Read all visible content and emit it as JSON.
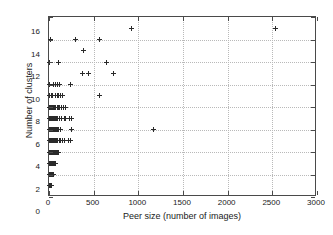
{
  "chart_data": {
    "type": "scatter",
    "title": "",
    "xlabel": "Peer size (number of images)",
    "ylabel": "Number of clusters",
    "xlim": [
      0,
      3000
    ],
    "ylim": [
      0,
      16
    ],
    "xticks": [
      0,
      500,
      1000,
      1500,
      2000,
      2500,
      3000
    ],
    "yticks": [
      0,
      2,
      4,
      6,
      8,
      10,
      12,
      14,
      16
    ],
    "grid": true,
    "legend": null,
    "marker": "+",
    "marker_color": "#2a2a2a",
    "series": [
      {
        "name": "peers",
        "points": [
          [
            8,
            1
          ],
          [
            12,
            1
          ],
          [
            16,
            1
          ],
          [
            20,
            1
          ],
          [
            24,
            1
          ],
          [
            28,
            1
          ],
          [
            10,
            1
          ],
          [
            14,
            1
          ],
          [
            8,
            2
          ],
          [
            14,
            2
          ],
          [
            20,
            2
          ],
          [
            26,
            2
          ],
          [
            32,
            2
          ],
          [
            38,
            2
          ],
          [
            44,
            2
          ],
          [
            50,
            2
          ],
          [
            12,
            2
          ],
          [
            18,
            2
          ],
          [
            24,
            2
          ],
          [
            30,
            2
          ],
          [
            8,
            3
          ],
          [
            14,
            3
          ],
          [
            20,
            3
          ],
          [
            26,
            3
          ],
          [
            32,
            3
          ],
          [
            38,
            3
          ],
          [
            44,
            3
          ],
          [
            50,
            3
          ],
          [
            56,
            3
          ],
          [
            62,
            3
          ],
          [
            68,
            3
          ],
          [
            16,
            3
          ],
          [
            22,
            3
          ],
          [
            34,
            3
          ],
          [
            46,
            3
          ],
          [
            8,
            4
          ],
          [
            14,
            4
          ],
          [
            20,
            4
          ],
          [
            26,
            4
          ],
          [
            32,
            4
          ],
          [
            38,
            4
          ],
          [
            44,
            4
          ],
          [
            50,
            4
          ],
          [
            56,
            4
          ],
          [
            62,
            4
          ],
          [
            68,
            4
          ],
          [
            74,
            4
          ],
          [
            80,
            4
          ],
          [
            95,
            4
          ],
          [
            110,
            4
          ],
          [
            18,
            4
          ],
          [
            30,
            4
          ],
          [
            42,
            4
          ],
          [
            54,
            4
          ],
          [
            8,
            5
          ],
          [
            14,
            5
          ],
          [
            20,
            5
          ],
          [
            26,
            5
          ],
          [
            32,
            5
          ],
          [
            38,
            5
          ],
          [
            44,
            5
          ],
          [
            50,
            5
          ],
          [
            56,
            5
          ],
          [
            62,
            5
          ],
          [
            70,
            5
          ],
          [
            78,
            5
          ],
          [
            86,
            5
          ],
          [
            100,
            5
          ],
          [
            115,
            5
          ],
          [
            130,
            5
          ],
          [
            150,
            5
          ],
          [
            170,
            5
          ],
          [
            215,
            5
          ],
          [
            240,
            5
          ],
          [
            24,
            5
          ],
          [
            36,
            5
          ],
          [
            8,
            6
          ],
          [
            14,
            6
          ],
          [
            20,
            6
          ],
          [
            26,
            6
          ],
          [
            32,
            6
          ],
          [
            38,
            6
          ],
          [
            44,
            6
          ],
          [
            50,
            6
          ],
          [
            56,
            6
          ],
          [
            64,
            6
          ],
          [
            72,
            6
          ],
          [
            80,
            6
          ],
          [
            90,
            6
          ],
          [
            105,
            6
          ],
          [
            130,
            6
          ],
          [
            250,
            6
          ],
          [
            1170,
            6
          ],
          [
            18,
            6
          ],
          [
            28,
            6
          ],
          [
            40,
            6
          ],
          [
            8,
            7
          ],
          [
            14,
            7
          ],
          [
            20,
            7
          ],
          [
            26,
            7
          ],
          [
            32,
            7
          ],
          [
            38,
            7
          ],
          [
            44,
            7
          ],
          [
            50,
            7
          ],
          [
            56,
            7
          ],
          [
            62,
            7
          ],
          [
            70,
            7
          ],
          [
            78,
            7
          ],
          [
            88,
            7
          ],
          [
            100,
            7
          ],
          [
            115,
            7
          ],
          [
            135,
            7
          ],
          [
            175,
            7
          ],
          [
            190,
            7
          ],
          [
            235,
            7
          ],
          [
            250,
            7
          ],
          [
            16,
            7
          ],
          [
            30,
            7
          ],
          [
            8,
            8
          ],
          [
            14,
            8
          ],
          [
            20,
            8
          ],
          [
            26,
            8
          ],
          [
            32,
            8
          ],
          [
            40,
            8
          ],
          [
            48,
            8
          ],
          [
            56,
            8
          ],
          [
            66,
            8
          ],
          [
            78,
            8
          ],
          [
            90,
            8
          ],
          [
            105,
            8
          ],
          [
            120,
            8
          ],
          [
            140,
            8
          ],
          [
            165,
            8
          ],
          [
            190,
            8
          ],
          [
            22,
            8
          ],
          [
            36,
            8
          ],
          [
            8,
            9
          ],
          [
            30,
            9
          ],
          [
            44,
            9
          ],
          [
            70,
            9
          ],
          [
            90,
            9
          ],
          [
            110,
            9
          ],
          [
            130,
            9
          ],
          [
            150,
            9
          ],
          [
            560,
            9
          ],
          [
            8,
            10
          ],
          [
            45,
            10
          ],
          [
            75,
            10
          ],
          [
            95,
            10
          ],
          [
            120,
            10
          ],
          [
            245,
            10
          ],
          [
            370,
            11
          ],
          [
            440,
            11
          ],
          [
            720,
            11
          ],
          [
            8,
            12
          ],
          [
            110,
            12
          ],
          [
            640,
            12
          ],
          [
            390,
            13
          ],
          [
            15,
            14
          ],
          [
            300,
            14
          ],
          [
            560,
            14
          ],
          [
            920,
            15
          ],
          [
            2530,
            15
          ]
        ]
      }
    ]
  }
}
